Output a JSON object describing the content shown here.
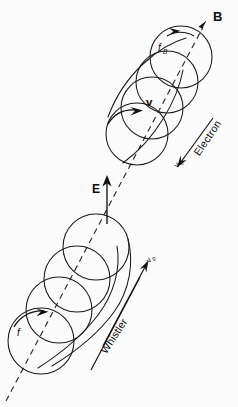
{
  "figure": {
    "background_color": "#fbfbfb",
    "ink_color": "#1a1a1a",
    "width": 238,
    "height": 407
  },
  "labels": {
    "magnetic_field": "B",
    "gyrofrequency": "f",
    "gyrofrequency_sub": "B",
    "velocity": "v",
    "electron": "Electron",
    "electron_parallel_speed": "v",
    "electron_parallel_speed_sub": "0",
    "electric_field": "E",
    "wave_frequency": "f",
    "whistler": "Whistler",
    "phase_velocity": "v",
    "phase_velocity_sub": "p"
  },
  "geometry": {
    "axis": {
      "start_x": 6,
      "start_y": 401,
      "end_x": 206,
      "end_y": 22,
      "style": "dashed",
      "arrow": "end"
    },
    "electron_helix": {
      "circle_count": 4,
      "radius": 31,
      "centers": [
        {
          "cx": 137,
          "cy": 134
        },
        {
          "cx": 152,
          "cy": 108
        },
        {
          "cx": 167,
          "cy": 82
        },
        {
          "cx": 181,
          "cy": 57
        }
      ]
    },
    "whistler_helix": {
      "circle_count": 4,
      "radius": 33,
      "centers": [
        {
          "cx": 41,
          "cy": 341
        },
        {
          "cx": 59,
          "cy": 310
        },
        {
          "cx": 77,
          "cy": 279
        },
        {
          "cx": 96,
          "cy": 247
        }
      ]
    }
  },
  "vectors": {
    "b_field_label_pos": {
      "x": 217,
      "y": 17
    },
    "fb_label_pos": {
      "x": 163,
      "y": 48
    },
    "v_label_pos": {
      "x": 150,
      "y": 104
    },
    "electron_label_angle": -62,
    "whistler_label_angle": -60,
    "e_field_label_pos": {
      "x": 95,
      "y": 186
    }
  }
}
